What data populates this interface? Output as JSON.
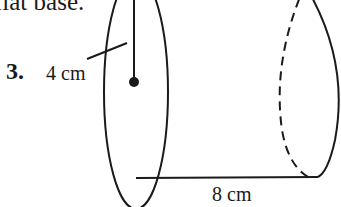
{
  "problem": {
    "intro_fragment": "flat base.",
    "number": "3.",
    "radius_label": "4 cm",
    "length_label": "8 cm"
  },
  "figure": {
    "shape": "cylinder",
    "radius": "4 cm",
    "height": "8 cm"
  }
}
